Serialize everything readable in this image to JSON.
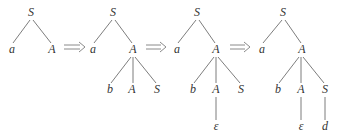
{
  "colors": {
    "edge": "#6e6e6e",
    "text": "#333333",
    "arrow": "#8a8a8a"
  },
  "trees": [
    {
      "nodes": [
        {
          "label": "S",
          "x": 31,
          "y": 16
        },
        {
          "label": "a",
          "x": 12,
          "y": 53
        },
        {
          "label": "A",
          "x": 52,
          "y": 53
        }
      ],
      "edges": [
        [
          30,
          20,
          13,
          43
        ],
        [
          33,
          20,
          51,
          43
        ]
      ]
    },
    {
      "nodes": [
        {
          "label": "S",
          "x": 113,
          "y": 16
        },
        {
          "label": "a",
          "x": 93,
          "y": 53
        },
        {
          "label": "A",
          "x": 133,
          "y": 53
        },
        {
          "label": "b",
          "x": 110,
          "y": 93
        },
        {
          "label": "A",
          "x": 132,
          "y": 93
        },
        {
          "label": "S",
          "x": 157,
          "y": 93
        }
      ],
      "edges": [
        [
          112,
          20,
          94,
          43
        ],
        [
          115,
          20,
          132,
          43
        ],
        [
          131,
          57,
          111,
          83
        ],
        [
          133,
          57,
          133,
          83
        ],
        [
          135,
          57,
          156,
          83
        ]
      ]
    },
    {
      "nodes": [
        {
          "label": "S",
          "x": 197,
          "y": 16
        },
        {
          "label": "a",
          "x": 177,
          "y": 53
        },
        {
          "label": "A",
          "x": 216,
          "y": 53
        },
        {
          "label": "b",
          "x": 193,
          "y": 93
        },
        {
          "label": "A",
          "x": 216,
          "y": 93
        },
        {
          "label": "S",
          "x": 241,
          "y": 93
        },
        {
          "label": "ε",
          "x": 216,
          "y": 130
        }
      ],
      "edges": [
        [
          196,
          20,
          178,
          43
        ],
        [
          199,
          20,
          215,
          43
        ],
        [
          214,
          57,
          194,
          83
        ],
        [
          216,
          57,
          216,
          83
        ],
        [
          218,
          57,
          240,
          83
        ],
        [
          216,
          97,
          216,
          120
        ]
      ]
    },
    {
      "nodes": [
        {
          "label": "S",
          "x": 283,
          "y": 16
        },
        {
          "label": "a",
          "x": 262,
          "y": 53
        },
        {
          "label": "A",
          "x": 302,
          "y": 53
        },
        {
          "label": "b",
          "x": 278,
          "y": 93
        },
        {
          "label": "A",
          "x": 301,
          "y": 93
        },
        {
          "label": "S",
          "x": 325,
          "y": 93
        },
        {
          "label": "ε",
          "x": 301,
          "y": 130
        },
        {
          "label": "d",
          "x": 325,
          "y": 130
        }
      ],
      "edges": [
        [
          282,
          20,
          263,
          43
        ],
        [
          285,
          20,
          301,
          43
        ],
        [
          299,
          57,
          279,
          83
        ],
        [
          301,
          57,
          301,
          83
        ],
        [
          303,
          57,
          324,
          83
        ],
        [
          301,
          97,
          301,
          120
        ],
        [
          325,
          97,
          325,
          120
        ]
      ]
    }
  ],
  "arrows": [
    {
      "x1": 64,
      "x2": 85,
      "y": 47
    },
    {
      "x1": 146,
      "x2": 166,
      "y": 47
    },
    {
      "x1": 230,
      "x2": 250,
      "y": 47
    }
  ],
  "labels": {
    "t0": [
      "S",
      "a",
      "A"
    ],
    "t1": [
      "S",
      "a",
      "A",
      "b",
      "A",
      "S"
    ],
    "t2": [
      "S",
      "a",
      "A",
      "b",
      "A",
      "S",
      "ε"
    ],
    "t3": [
      "S",
      "a",
      "A",
      "b",
      "A",
      "S",
      "ε",
      "d"
    ]
  }
}
